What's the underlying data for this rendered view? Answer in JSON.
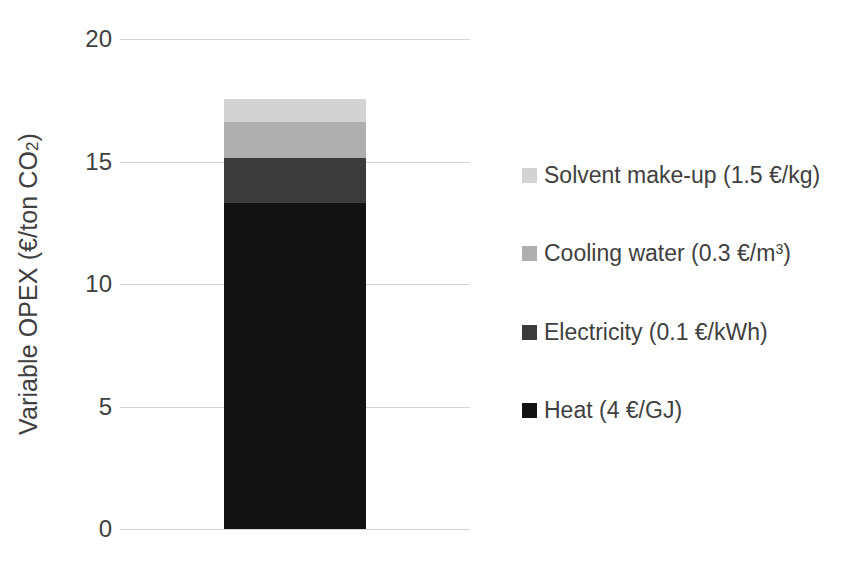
{
  "chart_data": {
    "type": "bar",
    "subtype": "stacked-column",
    "title": "",
    "xlabel": "",
    "ylabel": "Variable OPEX (€/ton CO₂)",
    "ylabel_parts": {
      "main": "Variable OPEX (€/ton CO",
      "sub": "2",
      "tail": ")"
    },
    "categories": [
      ""
    ],
    "ylim": [
      0,
      20
    ],
    "ytick_labels": [
      "20",
      "15",
      "10",
      "5",
      "0"
    ],
    "ytick_values": [
      20,
      15,
      10,
      5,
      0
    ],
    "grid": true,
    "legend_position": "right",
    "total": 17.56,
    "series": [
      {
        "name": "Heat (4 €/GJ)",
        "values": [
          13.29
        ],
        "color": "#121212",
        "order": 1
      },
      {
        "name": "Electricity (0.1 €/kWh)",
        "values": [
          1.84
        ],
        "color": "#3b3b3b",
        "order": 2
      },
      {
        "name": "Cooling water (0.3 €/m³)",
        "values": [
          1.49
        ],
        "color": "#afafaf",
        "order": 3
      },
      {
        "name": "Solvent make-up (1.5 €/kg)",
        "values": [
          0.94
        ],
        "color": "#d3d3d3",
        "order": 4
      }
    ],
    "stack_boundaries": [
      0,
      13.29,
      15.13,
      16.62,
      17.56
    ]
  },
  "legend": {
    "items": [
      {
        "label": "Solvent make-up (1.5 €/kg)",
        "color": "#d3d3d3",
        "label_main": "Solvent make-up (1.5 €/kg)",
        "label_sup": ""
      },
      {
        "label": "Cooling water (0.3 €/m³)",
        "color": "#afafaf",
        "label_main": "Cooling water (0.3 €/m",
        "label_sup": "3"
      },
      {
        "label": "Electricity (0.1 €/kWh)",
        "color": "#3b3b3b",
        "label_main": "Electricity (0.1 €/kWh)",
        "label_sup": ""
      },
      {
        "label": "Heat (4 €/GJ)",
        "color": "#121212",
        "label_main": "Heat (4 €/GJ)",
        "label_sup": ""
      }
    ]
  },
  "axis": {
    "ticks": [
      {
        "label": "20",
        "value": 20
      },
      {
        "label": "15",
        "value": 15
      },
      {
        "label": "10",
        "value": 10
      },
      {
        "label": "5",
        "value": 5
      },
      {
        "label": "0",
        "value": 0
      }
    ]
  },
  "colors": {
    "text": "#404040",
    "gridline": "#d4d4d4",
    "background": "#ffffff"
  }
}
